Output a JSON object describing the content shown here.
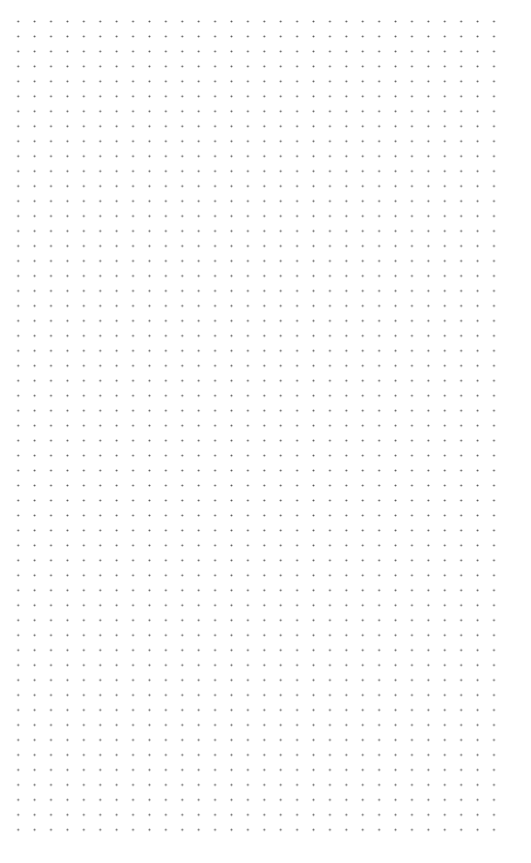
{
  "canvas": {
    "type": "dot-grid",
    "background_color": "#ffffff",
    "dot_color": "#555555",
    "columns": 30,
    "rows": 55,
    "spacing_x": 16.42,
    "spacing_y": 14.97
  }
}
